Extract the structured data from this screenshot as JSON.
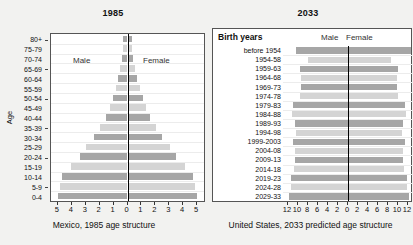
{
  "chart_data": [
    {
      "type": "bar",
      "id": "mexico-1985",
      "title": "1985",
      "caption": "Mexico, 1985 age structure",
      "ylabel": "Age",
      "xlabel": "",
      "orientation": "population-pyramid",
      "legend": [
        "Male",
        "Female"
      ],
      "legend_position": "inside-upper",
      "grid": true,
      "xlim": [
        -5.5,
        5.5
      ],
      "xticks": [
        5,
        4,
        3,
        2,
        1,
        0,
        1,
        2,
        3,
        4,
        5
      ],
      "xtick_values": [
        -5,
        -4,
        -3,
        -2,
        -1,
        0,
        1,
        2,
        3,
        4,
        5
      ],
      "categories": [
        "80+",
        "75-79",
        "70-74",
        "65-69",
        "60-64",
        "55-59",
        "50-54",
        "45-49",
        "40-44",
        "35-39",
        "30-34",
        "25-29",
        "20-24",
        "15-19",
        "10-14",
        "5-9",
        "0-4"
      ],
      "series": [
        {
          "name": "Male",
          "values": [
            0.32,
            0.3,
            0.4,
            0.52,
            0.66,
            0.84,
            1.02,
            1.26,
            1.55,
            1.95,
            2.4,
            2.95,
            3.45,
            4.05,
            4.7,
            4.85,
            5.0
          ]
        },
        {
          "name": "Female",
          "values": [
            0.34,
            0.32,
            0.43,
            0.56,
            0.7,
            0.88,
            1.08,
            1.32,
            1.62,
            2.02,
            2.48,
            3.02,
            3.5,
            4.1,
            4.72,
            4.88,
            5.02
          ]
        }
      ]
    },
    {
      "type": "bar",
      "id": "usa-2033",
      "title": "2033",
      "caption": "United States, 2033 predicted age structure",
      "ylabel": "Birth years",
      "xlabel": "",
      "orientation": "population-pyramid",
      "legend": [
        "Male",
        "Female"
      ],
      "legend_position": "inside-upper",
      "grid": true,
      "xlim": [
        -13,
        13
      ],
      "xticks": [
        12,
        10,
        8,
        6,
        4,
        2,
        0,
        2,
        4,
        6,
        8,
        10,
        12
      ],
      "xtick_values": [
        -12,
        -10,
        -8,
        -6,
        -4,
        -2,
        0,
        2,
        4,
        6,
        8,
        10,
        12
      ],
      "categories": [
        "before 1954",
        "1954-58",
        "1959-63",
        "1964-68",
        "1969-73",
        "1974-78",
        "1979-83",
        "1984-88",
        "1989-93",
        "1994-98",
        "1999-2003",
        "2004-08",
        "2009-13",
        "2014-18",
        "2019-23",
        "2024-28",
        "2029-33"
      ],
      "series": [
        {
          "name": "Male",
          "values": [
            10.4,
            8.1,
            9.6,
            9.4,
            9.5,
            9.6,
            11.0,
            11.2,
            10.7,
            10.4,
            11.0,
            10.6,
            10.6,
            10.8,
            11.4,
            11.5,
            11.8
          ]
        },
        {
          "name": "Female",
          "values": [
            12.6,
            8.6,
            9.9,
            9.7,
            9.8,
            9.9,
            11.4,
            11.6,
            11.0,
            10.7,
            11.3,
            10.9,
            10.9,
            11.1,
            11.7,
            11.8,
            12.1
          ]
        }
      ]
    }
  ],
  "left": {
    "title": "1985",
    "caption": "Mexico, 1985 age structure",
    "axis_title": "Age",
    "male_label": "Male",
    "female_label": "Female",
    "age_labels": [
      "80+",
      "75-79",
      "70-74",
      "65-69",
      "60-64",
      "55-59",
      "50-54",
      "45-49",
      "40-44",
      "35-39",
      "30-34",
      "25-29",
      "20-24",
      "15-19",
      "10-14",
      "5-9",
      "0-4"
    ],
    "tick_labels": [
      "5",
      "4",
      "3",
      "2",
      "1",
      "0",
      "1",
      "2",
      "3",
      "4",
      "5"
    ]
  },
  "right": {
    "title": "2033",
    "caption": "United States, 2033 predicted age structure",
    "header_label": "Birth years",
    "male_label": "Male",
    "female_label": "Female",
    "birth_year_labels": [
      "before 1954",
      "1954-58",
      "1959-63",
      "1964-68",
      "1969-73",
      "1974-78",
      "1979-83",
      "1984-88",
      "1989-93",
      "1994-98",
      "1999-2003",
      "2004-08",
      "2009-13",
      "2014-18",
      "2019-23",
      "2024-28",
      "2029-33"
    ],
    "tick_labels": [
      "12",
      "10",
      "8",
      "6",
      "4",
      "2",
      "0",
      "2",
      "4",
      "6",
      "8",
      "10",
      "12"
    ]
  },
  "colors": {
    "bar_dark": "#a6a6a6",
    "bar_light": "#d4d4d4",
    "center_axis": "#000000",
    "background": "#f2f2f0",
    "plot_background": "#ffffff",
    "border": "#555555"
  }
}
